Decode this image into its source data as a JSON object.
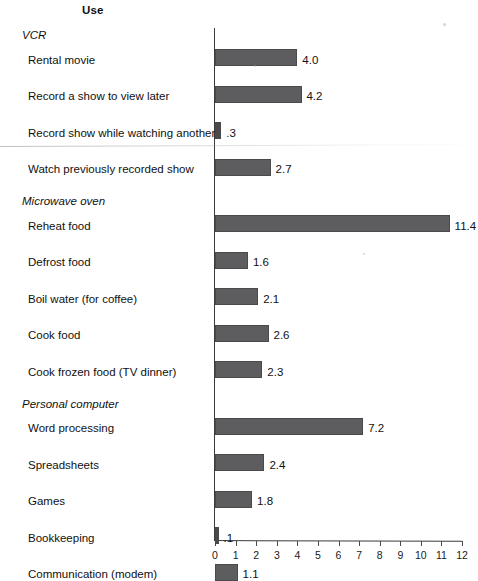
{
  "header": {
    "column_title": "Use"
  },
  "chart_data": {
    "type": "bar",
    "orientation": "horizontal",
    "title": "Use",
    "xlabel": "",
    "ylabel": "",
    "xlim": [
      0,
      12
    ],
    "xticks": [
      0,
      1,
      2,
      3,
      4,
      5,
      6,
      7,
      8,
      9,
      10,
      11,
      12
    ],
    "xtick_labels": [
      "0",
      "1",
      "2",
      "3",
      "4",
      "5",
      "6",
      "7",
      "8",
      "9",
      "10",
      "11",
      "12"
    ],
    "grid": false,
    "legend": null,
    "bar_color": "#5d5d5f",
    "axis_color": "#3b3b3b",
    "groups": [
      {
        "name": "VCR",
        "items": [
          {
            "label": "Rental movie",
            "value": 4.0,
            "value_label": "4.0"
          },
          {
            "label": "Record a show to view later",
            "value": 4.2,
            "value_label": "4.2"
          },
          {
            "label": "Record show while watching another",
            "value": 0.3,
            "value_label": ".3"
          },
          {
            "label": "Watch previously recorded show",
            "value": 2.7,
            "value_label": "2.7"
          }
        ]
      },
      {
        "name": "Microwave oven",
        "items": [
          {
            "label": "Reheat food",
            "value": 11.4,
            "value_label": "11.4"
          },
          {
            "label": "Defrost food",
            "value": 1.6,
            "value_label": "1.6"
          },
          {
            "label": "Boil water (for coffee)",
            "value": 2.1,
            "value_label": "2.1"
          },
          {
            "label": "Cook food",
            "value": 2.6,
            "value_label": "2.6"
          },
          {
            "label": "Cook frozen food (TV dinner)",
            "value": 2.3,
            "value_label": "2.3"
          }
        ]
      },
      {
        "name": "Personal computer",
        "items": [
          {
            "label": "Word processing",
            "value": 7.2,
            "value_label": "7.2"
          },
          {
            "label": "Spreadsheets",
            "value": 2.4,
            "value_label": "2.4"
          },
          {
            "label": "Games",
            "value": 1.8,
            "value_label": "1.8"
          },
          {
            "label": "Bookkeeping",
            "value": 0.1,
            "value_label": ".1"
          },
          {
            "label": "Communication (modem)",
            "value": 1.1,
            "value_label": "1.1"
          }
        ]
      }
    ]
  }
}
